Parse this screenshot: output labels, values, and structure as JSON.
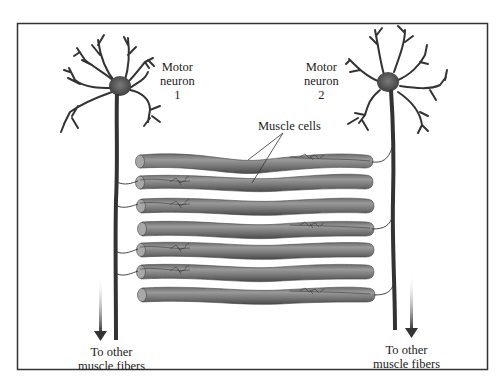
{
  "diagram": {
    "labels": {
      "neuron1": {
        "line1": "Motor",
        "line2": "neuron",
        "line3": "1"
      },
      "neuron2": {
        "line1": "Motor",
        "line2": "neuron",
        "line3": "2"
      },
      "muscle_cells": "Muscle cells",
      "other_fibers_left": {
        "line1": "To other",
        "line2": "muscle fibers"
      },
      "other_fibers_right": {
        "line1": "To other",
        "line2": "muscle fibers"
      }
    },
    "muscle_fibers": [
      {
        "index": 1,
        "innervated_by": "neuron2"
      },
      {
        "index": 2,
        "innervated_by": "neuron1"
      },
      {
        "index": 3,
        "innervated_by": "neuron1"
      },
      {
        "index": 4,
        "innervated_by": "neuron2"
      },
      {
        "index": 5,
        "innervated_by": "neuron1"
      },
      {
        "index": 6,
        "innervated_by": "neuron1"
      },
      {
        "index": 7,
        "innervated_by": "neuron2"
      }
    ],
    "colors": {
      "frame": "#333333",
      "fiber_dark": "#5a5a5a",
      "fiber_mid": "#8a8a8a",
      "fiber_light": "#b5b5b5",
      "neuron": "#3a3a3a",
      "text": "#222222"
    }
  }
}
